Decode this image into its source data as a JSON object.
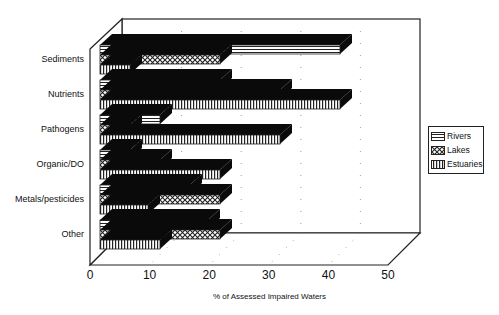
{
  "chart_data": {
    "type": "bar",
    "orientation": "horizontal",
    "style": "3d",
    "title": "",
    "xlabel": "% of Assessed Impaired Waters",
    "ylabel": "",
    "xlim": [
      0,
      50
    ],
    "x_ticks": [
      0,
      10,
      20,
      30,
      40,
      50
    ],
    "grid": true,
    "legend_position": "right",
    "categories": [
      "Sediments",
      "Nutrients",
      "Pathogens",
      "Organic/DO",
      "Metals/pesticides",
      "Other"
    ],
    "series": [
      {
        "name": "Rivers",
        "pattern": "horizontal-stripes",
        "values": [
          40,
          20,
          10,
          5,
          15,
          18
        ]
      },
      {
        "name": "Lakes",
        "pattern": "crosshatch",
        "values": [
          20,
          30,
          5,
          10,
          20,
          20
        ]
      },
      {
        "name": "Estuaries",
        "pattern": "vertical-stripes",
        "values": [
          5,
          40,
          30,
          20,
          8,
          10
        ]
      }
    ]
  },
  "colors": {
    "bar_fill": "#ffffff",
    "pattern_ink": "#222222",
    "bar_depth": "#0a0a0a",
    "frame": "#222222",
    "grid": "#888888"
  }
}
